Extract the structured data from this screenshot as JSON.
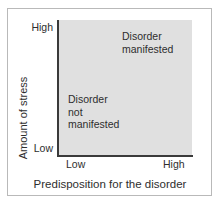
{
  "figure": {
    "name": "diathesis-stress-model",
    "width": 220,
    "height": 204,
    "background_color": "#ffffff",
    "frame_border_color": "#b9b9b9"
  },
  "chart_data": {
    "type": "diagram",
    "title": "",
    "xlabel": "Predisposition for the disorder",
    "ylabel": "Amount of stress",
    "x_tick_labels": [
      "Low",
      "High"
    ],
    "y_tick_labels": [
      "Low",
      "High"
    ],
    "grid": false,
    "legend": "none",
    "plot_area_fill": "#e0e0e0",
    "axis_color": "#3a3a3a",
    "text_color": "#2e2e2e",
    "regions": [
      {
        "name": "disorder-manifested",
        "label": "Disorder\nmanifested",
        "position": "upper-right"
      },
      {
        "name": "disorder-not-manifested",
        "label": "Disorder\nnot\nmanifested",
        "position": "lower-left"
      }
    ]
  },
  "axes": {
    "y": {
      "title": "Amount of stress",
      "high_label": "High",
      "low_label": "Low"
    },
    "x": {
      "title": "Predisposition for the disorder",
      "low_label": "Low",
      "high_label": "High"
    }
  }
}
